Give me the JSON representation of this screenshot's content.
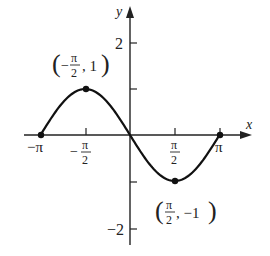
{
  "chart_data": {
    "type": "line",
    "title": "",
    "function": "y = -sin(x)",
    "xlabel": "x",
    "ylabel": "y",
    "xlim": [
      -3.1416,
      3.1416
    ],
    "ylim": [
      -2,
      2
    ],
    "grid": false,
    "legend": null,
    "x_ticks": [
      {
        "value": -3.1416,
        "label": "−π"
      },
      {
        "value": -1.5708,
        "label": "−π/2"
      },
      {
        "value": 1.5708,
        "label": "π/2"
      },
      {
        "value": 3.1416,
        "label": "π"
      }
    ],
    "y_ticks": [
      {
        "value": 2,
        "label": "2"
      },
      {
        "value": 1,
        "label": ""
      },
      {
        "value": -1,
        "label": ""
      },
      {
        "value": -2,
        "label": "−2"
      }
    ],
    "series": [
      {
        "name": "curve",
        "x": [
          -3.1416,
          -2.3562,
          -1.5708,
          -0.7854,
          0,
          0.7854,
          1.5708,
          2.3562,
          3.1416
        ],
        "y": [
          0,
          0.7071,
          1,
          0.7071,
          0,
          -0.7071,
          -1,
          -0.7071,
          0
        ]
      }
    ],
    "points": [
      {
        "x": -3.1416,
        "y": 0,
        "label": ""
      },
      {
        "x": -1.5708,
        "y": 1,
        "label": "(−π/2, 1)"
      },
      {
        "x": 1.5708,
        "y": -1,
        "label": "(π/2, −1)"
      },
      {
        "x": 3.1416,
        "y": 0,
        "label": ""
      }
    ],
    "annotations": [
      "(−π/2, 1)",
      "(π/2, −1)"
    ]
  },
  "labels": {
    "x_axis": "x",
    "y_axis": "y",
    "tick_neg_pi": "−π",
    "tick_pi": "π",
    "tick_pi_num": "π",
    "tick_den": "2",
    "tick_minus": "−",
    "y_tick_2": "2",
    "y_tick_neg2": "−2",
    "max_point_open": "(",
    "max_point_minus": "−",
    "max_point_pi": "π",
    "max_point_den": "2",
    "max_point_rest": ", 1",
    "max_point_close": ")",
    "min_point_open": "(",
    "min_point_pi": "π",
    "min_point_den": "2",
    "min_point_rest": ", −1",
    "min_point_close": ")"
  }
}
